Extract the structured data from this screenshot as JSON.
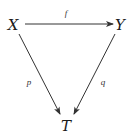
{
  "diagram": {
    "type": "commutative-triangle",
    "nodes": [
      {
        "id": "X",
        "label": "X",
        "x": 13,
        "y": 25
      },
      {
        "id": "Y",
        "label": "Y",
        "x": 120,
        "y": 25
      },
      {
        "id": "T",
        "label": "T",
        "x": 66,
        "y": 126
      }
    ],
    "edges": [
      {
        "from": "X",
        "to": "Y",
        "label": "f",
        "x1": 25,
        "y1": 24,
        "x2": 113,
        "y2": 24,
        "label_x": 66,
        "label_y": 13
      },
      {
        "from": "X",
        "to": "T",
        "label": "p",
        "x1": 19,
        "y1": 34,
        "x2": 60,
        "y2": 114,
        "label_x": 29,
        "label_y": 82
      },
      {
        "from": "Y",
        "to": "T",
        "label": "q",
        "x1": 115,
        "y1": 34,
        "x2": 74,
        "y2": 114,
        "label_x": 103,
        "label_y": 82
      }
    ],
    "colors": {
      "stroke": "#333333",
      "text": "#1a1a1a",
      "background": "#ffffff"
    }
  }
}
